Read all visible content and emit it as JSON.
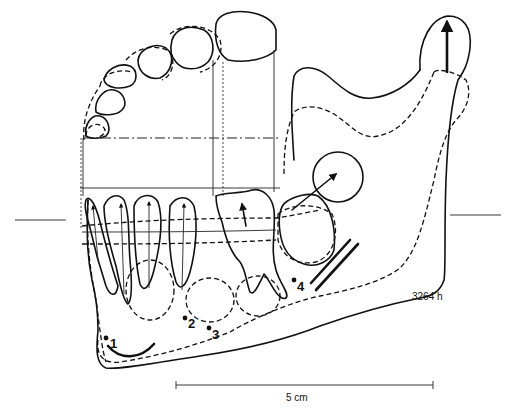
{
  "figure": {
    "id_label": "3264 h",
    "scale_bar": {
      "label": "5 cm",
      "x1": 176,
      "x2": 433,
      "y": 385
    },
    "landmarks": [
      {
        "label": "1",
        "x": 106,
        "y": 338
      },
      {
        "label": "2",
        "x": 185,
        "y": 318
      },
      {
        "label": "3",
        "x": 209,
        "y": 328
      },
      {
        "label": "4",
        "x": 294,
        "y": 280
      }
    ],
    "legend_lines": {
      "left_reference_line": {
        "x1": 15,
        "x2": 66,
        "y": 220
      },
      "right_reference_line": {
        "x1": 450,
        "x2": 501,
        "y": 215
      }
    },
    "colors": {
      "line": "#111111",
      "background": "#ffffff"
    }
  }
}
